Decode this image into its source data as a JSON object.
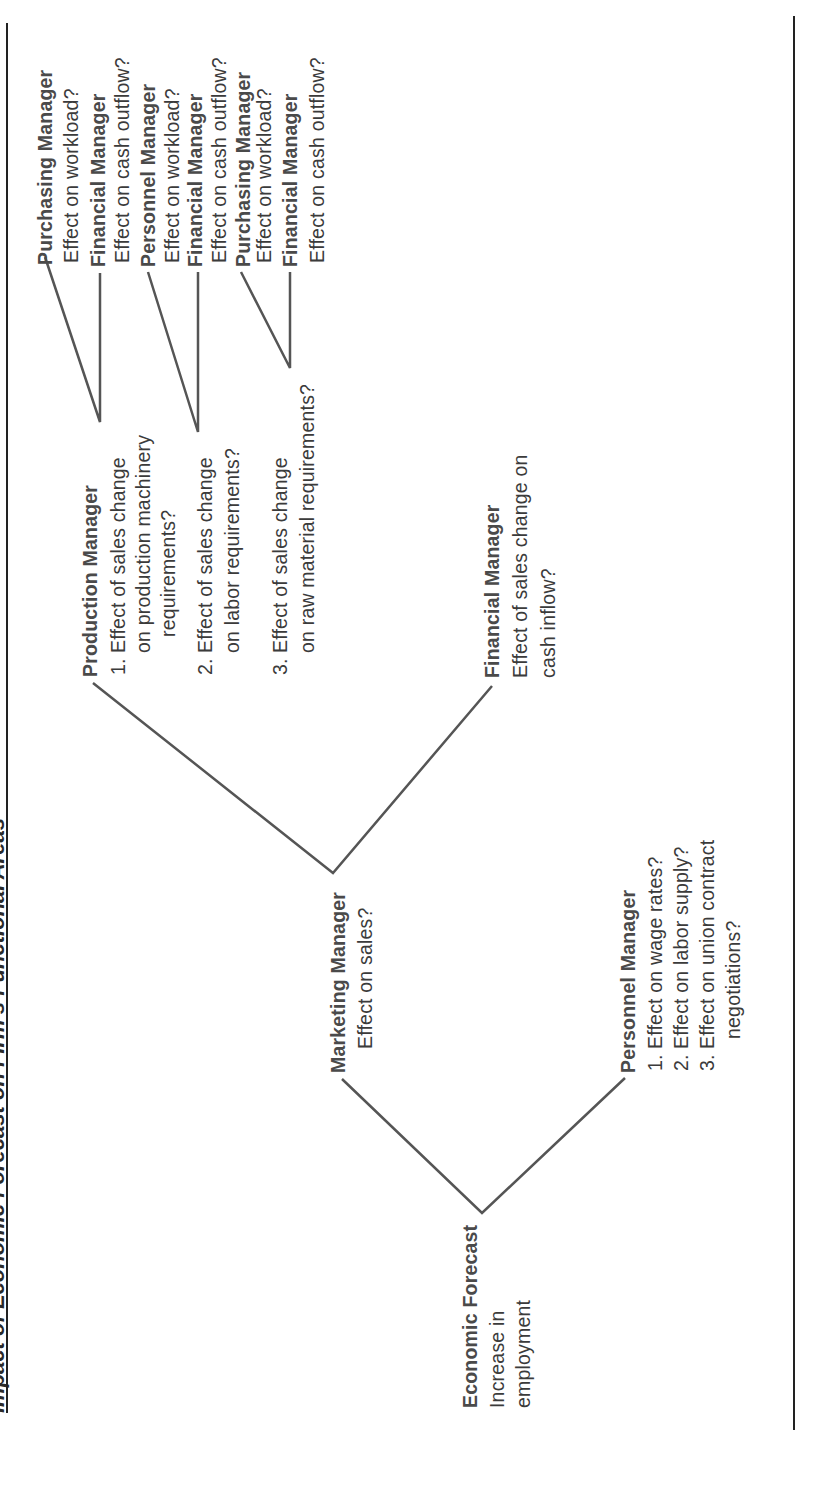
{
  "title": "Impact of Economic Forecast on Firm's Functional Areas",
  "colors": {
    "line": "#555555",
    "text": "#3b3b3b",
    "label": "#4a4a4a",
    "rule": "#222222"
  },
  "root": {
    "label": "Economic Forecast",
    "desc": [
      "Increase in",
      "employment"
    ]
  },
  "marketing": {
    "label": "Marketing Manager",
    "desc": "Effect on sales?"
  },
  "personnel": {
    "label": "Personnel Manager",
    "items": [
      {
        "num": "1.",
        "text": "Effect on wage rates?"
      },
      {
        "num": "2.",
        "text": "Effect on labor supply?"
      },
      {
        "num": "3.",
        "text": "Effect on union contract"
      }
    ],
    "cont": "negotiations?"
  },
  "production": {
    "label": "Production Manager",
    "items": [
      {
        "num": "1.",
        "lines": [
          "Effect of sales change",
          "on production machinery",
          "requirements?"
        ]
      },
      {
        "num": "2.",
        "lines": [
          "Effect of sales change",
          "on labor requirements?"
        ]
      },
      {
        "num": "3.",
        "lines": [
          "Effect of sales change",
          "on raw material requirements?"
        ]
      }
    ]
  },
  "financial": {
    "label": "Financial Manager",
    "desc": [
      "Effect of sales change on",
      "cash inflow?"
    ]
  },
  "leaves": [
    {
      "label": "Purchasing Manager",
      "desc": "Effect on workload?"
    },
    {
      "label": "Financial Manager",
      "desc": "Effect on cash outflow?"
    },
    {
      "label": "Personnel Manager",
      "desc": "Effect on workload?"
    },
    {
      "label": "Financial Manager",
      "desc": "Effect on cash outflow?"
    },
    {
      "label": "Purchasing Manager",
      "desc": "Effect on workload?"
    },
    {
      "label": "Financial Manager",
      "desc": "Effect on cash outflow?"
    }
  ]
}
